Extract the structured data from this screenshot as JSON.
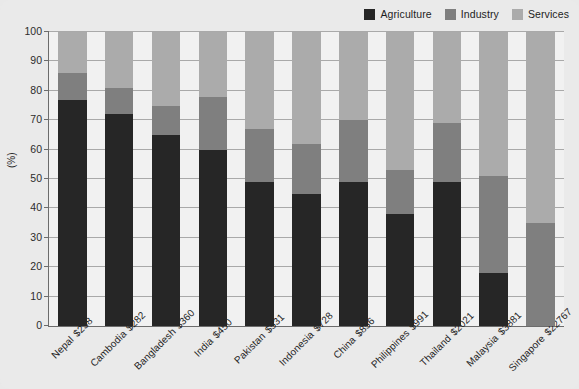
{
  "chart_data": {
    "type": "bar",
    "subtype": "stacked-bar",
    "title": "",
    "xlabel": "",
    "ylabel": "(%)",
    "ylim": [
      0,
      100
    ],
    "yticks": [
      0,
      10,
      20,
      30,
      40,
      50,
      60,
      70,
      80,
      90,
      100
    ],
    "grid": true,
    "legend_position": "top-right",
    "stacked_total": 100,
    "categories": [
      "Nepal",
      "Cambodia",
      "Bangladesh",
      "India",
      "Pakistan",
      "Indonesia",
      "China",
      "Philippines",
      "Thailand",
      "Malaysia",
      "Singapore"
    ],
    "category_values": [
      "$238",
      "$282",
      "$360",
      "$450",
      "$531",
      "$728",
      "$856",
      "$991",
      "$2021",
      "$3881",
      "$22767"
    ],
    "tick_labels": [
      "Nepal $238",
      "Cambodia $282",
      "Bangladesh $360",
      "India $450",
      "Pakistan $531",
      "Indonesia $728",
      "China $856",
      "Philippines $991",
      "Thailand $2021",
      "Malaysia $3881",
      "Singapore $22767"
    ],
    "series": [
      {
        "name": "Agriculture",
        "color": "#262626",
        "values": [
          77,
          72,
          65,
          60,
          49,
          45,
          49,
          38,
          49,
          18,
          0
        ]
      },
      {
        "name": "Industry",
        "color": "#7f7f7f",
        "values": [
          9,
          9,
          10,
          18,
          18,
          17,
          21,
          15,
          20,
          33,
          35
        ]
      },
      {
        "name": "Services",
        "color": "#ababab",
        "values": [
          14,
          19,
          25,
          22,
          33,
          38,
          30,
          47,
          31,
          49,
          65
        ]
      }
    ],
    "cumulative_tops": {
      "agriculture": [
        77,
        72,
        65,
        60,
        49,
        45,
        49,
        38,
        49,
        18,
        0
      ],
      "industry": [
        86,
        81,
        75,
        78,
        67,
        62,
        70,
        53,
        69,
        51,
        35
      ],
      "services": [
        100,
        100,
        100,
        100,
        100,
        100,
        100,
        100,
        100,
        100,
        100
      ]
    }
  },
  "legend": {
    "entries": [
      {
        "label": "Agriculture",
        "color": "#262626"
      },
      {
        "label": "Industry",
        "color": "#7f7f7f"
      },
      {
        "label": "Services",
        "color": "#ababab"
      }
    ]
  },
  "colors": {
    "background": "#eaeaea",
    "plot_background": "#f1f1f1",
    "axis": "#6c6c6c",
    "gridline": "#a9a9a9",
    "text": "#1f1f1f"
  }
}
